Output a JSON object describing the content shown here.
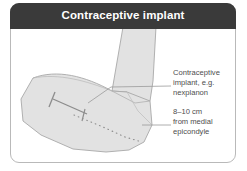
{
  "card": {
    "header": {
      "title": "Contraceptive implant",
      "background_color": "#3a3a3a",
      "text_color": "#ffffff"
    },
    "border_color": "#b9b9b9",
    "background_color": "#ffffff"
  },
  "illustration": {
    "name": "flexed-arm-with-implant-diagram",
    "fill_color": "#e2e2e2",
    "outline_color": "#a8a8a8",
    "marker_color": "#8c8c8c",
    "leader_line_color": "#9a9a9a",
    "parts": [
      "upper-arm",
      "forearm",
      "elbow-crease",
      "implant-marker",
      "medial-epicondyle-dotted-line"
    ]
  },
  "annotations": [
    {
      "id": "implant",
      "lines": [
        "Contraceptive",
        "implant, e.g.",
        "nexplanon"
      ],
      "text": "Contraceptive implant, e.g. nexplanon",
      "text_color": "#4d4d4d"
    },
    {
      "id": "distance",
      "lines": [
        "8–10 cm",
        "from medial",
        "epicondyle"
      ],
      "text": "8–10 cm from medial epicondyle",
      "text_color": "#4d4d4d"
    }
  ]
}
